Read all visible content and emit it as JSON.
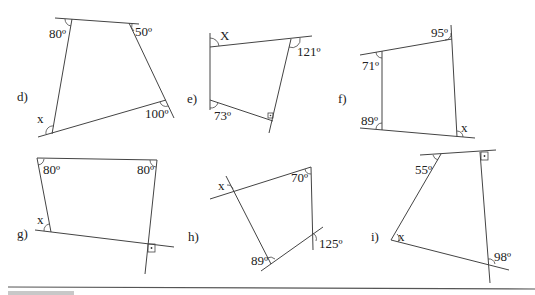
{
  "worksheet": {
    "problems": [
      {
        "id": "d",
        "label": "d)",
        "angles": [
          "80º",
          "50º",
          "100º",
          "x"
        ]
      },
      {
        "id": "e",
        "label": "e)",
        "angles": [
          "X",
          "121º",
          "73º",
          "right-angle"
        ]
      },
      {
        "id": "f",
        "label": "f)",
        "angles": [
          "95º",
          "71º",
          "89º",
          "x"
        ]
      },
      {
        "id": "g",
        "label": "g)",
        "angles": [
          "80º",
          "80º",
          "x",
          "right-angle"
        ]
      },
      {
        "id": "h",
        "label": "h)",
        "angles": [
          "x",
          "70º",
          "125º",
          "89º"
        ]
      },
      {
        "id": "i",
        "label": "i)",
        "angles": [
          "55º",
          "right-angle",
          "x",
          "98º"
        ]
      }
    ]
  },
  "d": {
    "label": "d)",
    "a_top_left": "80º",
    "a_top_right": "50º",
    "a_bottom_right": "100º",
    "a_bottom_left": "x"
  },
  "e": {
    "label": "e)",
    "a_top_left": "X",
    "a_top_right": "121º",
    "a_bottom_left": "73º"
  },
  "f": {
    "label": "f)",
    "a_top_right": "95º",
    "a_top_left": "71º",
    "a_bottom_left": "89º",
    "a_bottom_right": "x"
  },
  "g": {
    "label": "g)",
    "a_top_left": "80º",
    "a_top_right": "80º",
    "a_bottom_left": "x"
  },
  "h": {
    "label": "h)",
    "a_top_left": "x",
    "a_top_right": "70º",
    "a_bottom_right": "125º",
    "a_bottom_left": "89º"
  },
  "i": {
    "label": "i)",
    "a_top_left": "55º",
    "a_bottom_left": "x",
    "a_bottom_right": "98º"
  }
}
